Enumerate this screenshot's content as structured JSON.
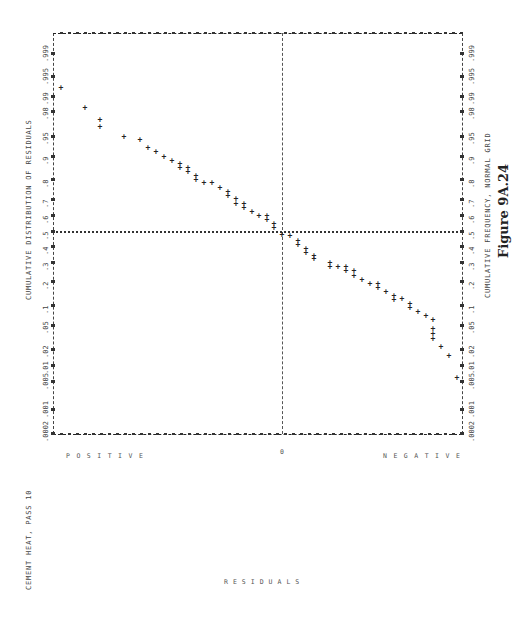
{
  "page": {
    "run_label": "CEMENT HEAT, PASS 10",
    "figure_caption": "Figure 9A.24"
  },
  "chart_data": {
    "type": "scatter",
    "title": "CUMULATIVE DISTRIBUTION OF RESIDUALS",
    "xlabel": "RESIDUALS",
    "ylabel": "CUMULATIVE FREQUENCY, NORMAL GRID",
    "orientation_note_visible": "Plot printed rotated 90 degrees on page",
    "residual_axis_labels": {
      "positive": "POSITIVE",
      "zero": "0",
      "negative": "NEGATIVE"
    },
    "frequency_ticks": [
      ".0002",
      ".001",
      ".005",
      ".01",
      ".02",
      ".05",
      ".1",
      ".2",
      ".3",
      ".4",
      ".5",
      ".6",
      ".7",
      ".8",
      ".9",
      ".95",
      ".98",
      ".99",
      ".995",
      ".999"
    ],
    "reference_lines": {
      "residual_zero": true,
      "frequency_half": ".5"
    },
    "grid": false,
    "points_pixel": [
      [
        61,
        88
      ],
      [
        85,
        108
      ],
      [
        100,
        120
      ],
      [
        100,
        127
      ],
      [
        124,
        137
      ],
      [
        140,
        140
      ],
      [
        148,
        148
      ],
      [
        156,
        152
      ],
      [
        164,
        157
      ],
      [
        172,
        161
      ],
      [
        180,
        164
      ],
      [
        180,
        168
      ],
      [
        188,
        168
      ],
      [
        188,
        172
      ],
      [
        196,
        176
      ],
      [
        196,
        180
      ],
      [
        204,
        183
      ],
      [
        212,
        183
      ],
      [
        220,
        188
      ],
      [
        228,
        192
      ],
      [
        228,
        196
      ],
      [
        236,
        199
      ],
      [
        236,
        204
      ],
      [
        244,
        204
      ],
      [
        244,
        208
      ],
      [
        252,
        212
      ],
      [
        259,
        216
      ],
      [
        267,
        216
      ],
      [
        267,
        220
      ],
      [
        274,
        224
      ],
      [
        274,
        228
      ],
      [
        282,
        235
      ],
      [
        290,
        236
      ],
      [
        298,
        241
      ],
      [
        298,
        245
      ],
      [
        306,
        249
      ],
      [
        306,
        253
      ],
      [
        314,
        256
      ],
      [
        314,
        259
      ],
      [
        330,
        263
      ],
      [
        330,
        267
      ],
      [
        338,
        267
      ],
      [
        346,
        267
      ],
      [
        346,
        271
      ],
      [
        354,
        271
      ],
      [
        354,
        276
      ],
      [
        362,
        280
      ],
      [
        370,
        284
      ],
      [
        378,
        284
      ],
      [
        378,
        288
      ],
      [
        386,
        292
      ],
      [
        394,
        296
      ],
      [
        394,
        300
      ],
      [
        402,
        299
      ],
      [
        410,
        304
      ],
      [
        410,
        308
      ],
      [
        418,
        312
      ],
      [
        426,
        316
      ],
      [
        433,
        320
      ],
      [
        433,
        329
      ],
      [
        433,
        334
      ],
      [
        433,
        339
      ],
      [
        441,
        347
      ],
      [
        449,
        356
      ],
      [
        457,
        378
      ]
    ],
    "point_marker": "+"
  }
}
